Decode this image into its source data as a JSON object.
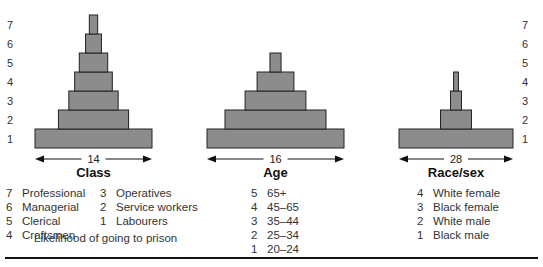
{
  "chart_data": [
    {
      "type": "bar",
      "subtype": "stepped-pyramid",
      "title": "Class",
      "span_label": "14",
      "categories": [
        "1",
        "2",
        "3",
        "4",
        "5",
        "6",
        "7"
      ],
      "values": [
        14,
        8.4,
        5.9,
        4.5,
        3.4,
        1.9,
        1.0
      ],
      "category_names": {
        "7": "Professional",
        "6": "Managerial",
        "5": "Clerical",
        "4": "Craftsmen",
        "3": "Operatives",
        "2": "Service workers",
        "1": "Labourers"
      }
    },
    {
      "type": "bar",
      "subtype": "stepped-pyramid",
      "title": "Age",
      "span_label": "16",
      "categories": [
        "1",
        "2",
        "3",
        "4",
        "5"
      ],
      "values": [
        16,
        11.8,
        7.1,
        4.3,
        1.3
      ],
      "category_names": {
        "5": "65+",
        "4": "45–65",
        "3": "35–44",
        "2": "25–34",
        "1": "20–24"
      }
    },
    {
      "type": "bar",
      "subtype": "stepped-pyramid",
      "title": "Race/sex",
      "span_label": "28",
      "categories": [
        "1",
        "2",
        "3",
        "4"
      ],
      "values": [
        28,
        7.6,
        2.7,
        1.2
      ],
      "category_names": {
        "4": "White female",
        "3": "Black female",
        "2": "White male",
        "1": "Black male"
      }
    }
  ],
  "y_ticks": [
    "1",
    "2",
    "3",
    "4",
    "5",
    "6",
    "7"
  ],
  "legend_class_col1": [
    {
      "num": "7",
      "label": "Professional"
    },
    {
      "num": "6",
      "label": "Managerial"
    },
    {
      "num": "5",
      "label": "Clerical"
    },
    {
      "num": "4",
      "label": "Craftsmen"
    }
  ],
  "legend_class_col2": [
    {
      "num": "3",
      "label": "Operatives"
    },
    {
      "num": "2",
      "label": "Service workers"
    },
    {
      "num": "1",
      "label": "Labourers"
    }
  ],
  "legend_age": [
    {
      "num": "5",
      "label": "65+"
    },
    {
      "num": "4",
      "label": "45–65"
    },
    {
      "num": "3",
      "label": "35–44"
    },
    {
      "num": "2",
      "label": "25–34"
    },
    {
      "num": "1",
      "label": "20–24"
    }
  ],
  "legend_race": [
    {
      "num": "4",
      "label": "White female"
    },
    {
      "num": "3",
      "label": "Black female"
    },
    {
      "num": "2",
      "label": "White male"
    },
    {
      "num": "1",
      "label": "Black male"
    }
  ],
  "caption": "Likelihood of going to prison"
}
